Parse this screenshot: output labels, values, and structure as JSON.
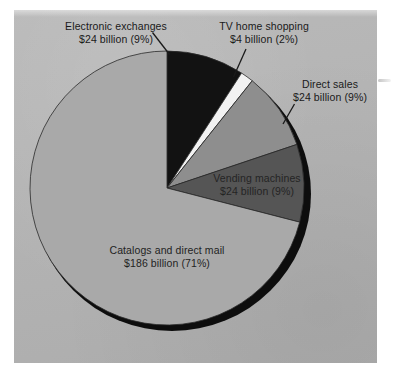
{
  "figure": {
    "background_color": "#ffffff",
    "panel_color": "#b5b5b5"
  },
  "chart_data": {
    "type": "pie",
    "title": "",
    "subtitle": "",
    "xlabel": "",
    "ylabel": "",
    "units": "billion US dollars",
    "total_label": "$262 billion",
    "legend_position": "none",
    "grid": false,
    "labels_on_slices": true,
    "start_angle_deg": 0,
    "direction": "clockwise",
    "categories": [
      "Electronic exchanges",
      "TV home shopping",
      "Direct sales",
      "Vending machines",
      "Catalogs and direct mail"
    ],
    "values": [
      24,
      4,
      24,
      24,
      186
    ],
    "percentages": [
      9,
      2,
      9,
      9,
      71
    ],
    "colors": [
      "#121212",
      "#f2f2f2",
      "#8e8e8e",
      "#555555",
      "#a9a9a9"
    ],
    "slices": [
      {
        "name": "Electronic exchanges",
        "value": 24,
        "percent": 9,
        "value_text": "$24 billion (9%)",
        "color": "#121212",
        "label_line1": "Electronic exchanges",
        "label_line2": "$24 billion (9%)",
        "label_placement": "outside-top-left"
      },
      {
        "name": "TV home shopping",
        "value": 4,
        "percent": 2,
        "value_text": "$4 billion (2%)",
        "color": "#f2f2f2",
        "label_line1": "TV home shopping",
        "label_line2": "$4 billion (2%)",
        "label_placement": "outside-top-right"
      },
      {
        "name": "Direct sales",
        "value": 24,
        "percent": 9,
        "value_text": "$24 billion (9%)",
        "color": "#8e8e8e",
        "label_line1": "Direct sales",
        "label_line2": "$24 billion (9%)",
        "label_placement": "outside-right"
      },
      {
        "name": "Vending machines",
        "value": 24,
        "percent": 9,
        "value_text": "$24 billion (9%)",
        "color": "#555555",
        "label_line1": "Vending machines",
        "label_line2": "$24 billion (9%)",
        "label_placement": "inside-slice"
      },
      {
        "name": "Catalogs and direct mail",
        "value": 186,
        "percent": 71,
        "value_text": "$186 billion (71%)",
        "color": "#a9a9a9",
        "label_line1": "Catalogs and direct mail",
        "label_line2": "$186 billion (71%)",
        "label_placement": "inside-slice"
      }
    ]
  }
}
